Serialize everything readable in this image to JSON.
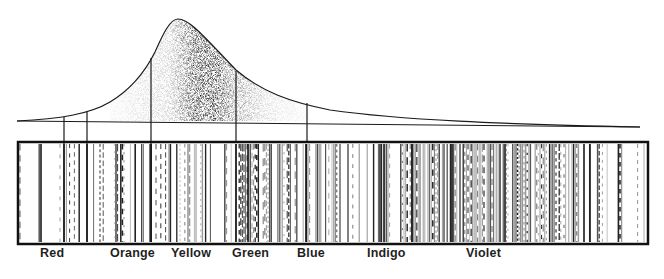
{
  "figure": {
    "ink_color": "#1a1a1a",
    "background": "#ffffff"
  },
  "curve": {
    "peak_x": 178,
    "peak_y": 19,
    "baseline_y": 121,
    "dividers_x": [
      64,
      87,
      151,
      236,
      307
    ]
  },
  "spectrum_box": {
    "x": 17,
    "y": 142,
    "width": 631,
    "height": 102
  },
  "labels": [
    {
      "text": "Red",
      "x": 40
    },
    {
      "text": "Orange",
      "x": 110
    },
    {
      "text": "Yellow",
      "x": 171
    },
    {
      "text": "Green",
      "x": 232
    },
    {
      "text": "Blue",
      "x": 297
    },
    {
      "text": "Indigo",
      "x": 367
    },
    {
      "text": "Violet",
      "x": 466
    }
  ]
}
